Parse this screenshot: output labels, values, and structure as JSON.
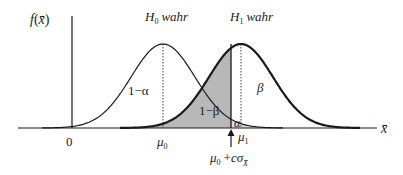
{
  "diagram": {
    "type": "hypothesis-test-error-regions",
    "y_axis_label": "f(x̄)",
    "y_axis_label_func": "f",
    "y_axis_label_var": "x̄",
    "x_axis_label": "x̄",
    "curves": [
      {
        "id": "h0",
        "label_main": "H",
        "label_sub": "0",
        "label_suffix": "wahr",
        "mean_label_main": "μ",
        "mean_label_sub": "0",
        "line_style": "thin"
      },
      {
        "id": "h1",
        "label_main": "H",
        "label_sub": "1",
        "label_suffix": "wahr",
        "mean_label_main": "μ",
        "mean_label_sub": "1",
        "line_style": "bold"
      }
    ],
    "tick_zero": "0",
    "regions": {
      "one_minus_alpha": "1−α",
      "one_minus_beta": "1−β",
      "beta": "β",
      "alpha": "α"
    },
    "critical_value": {
      "label_prefix": "μ",
      "label_prefix_sub": "0",
      "label_op": "+",
      "label_c": "c",
      "label_sigma": "σ",
      "label_sigma_sub": "X̄"
    },
    "colors": {
      "shade_power": "#b8b8b8",
      "shade_alpha": "#dcdcdc",
      "line": "#1a1a1a"
    }
  }
}
